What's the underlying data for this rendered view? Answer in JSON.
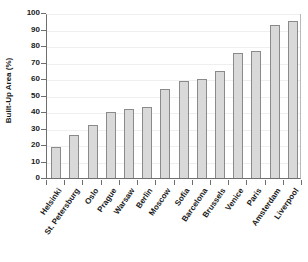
{
  "chart_data": {
    "type": "bar",
    "title": "",
    "xlabel": "",
    "ylabel": "Built-Up Area (%)",
    "ylim": [
      0,
      100
    ],
    "ytick_step": 10,
    "yticks": [
      0,
      10,
      20,
      30,
      40,
      50,
      60,
      70,
      80,
      90,
      100
    ],
    "grid": true,
    "legend": null,
    "categories": [
      "Helsinki",
      "St. Petersburg",
      "Oslo",
      "Prague",
      "Warsaw",
      "Berlin",
      "Moscow",
      "Sofia",
      "Barcelona",
      "Brussels",
      "Venice",
      "Paris",
      "Amsterdam",
      "Liverpool"
    ],
    "values": [
      19,
      26,
      32,
      40,
      42,
      43,
      54,
      59,
      60,
      65,
      76,
      77,
      93,
      95
    ],
    "bar_fill": "#d9d9d9",
    "bar_border": "#8a8a8a",
    "axis_color": "#6e6e6e",
    "grid_color": "#efefef",
    "text_color": "#1a1a1a",
    "background": "#ffffff"
  }
}
